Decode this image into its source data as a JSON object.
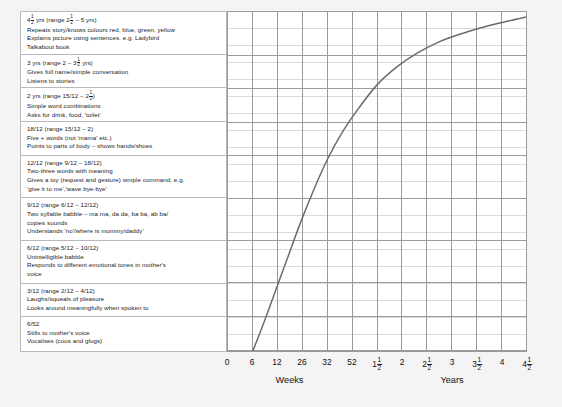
{
  "milestones": [
    {
      "id": "4.5yrs",
      "lines": [
        "4&frac;1;2; yrs (range 2&frac;1;2; – 5 yrs)",
        "Repeats story/knows colours red, blue, green, yellow",
        "Explains picture using sentences. e.g. Ladybird",
        "Talkabout book"
      ]
    },
    {
      "id": "3yrs",
      "lines": [
        "3 yrs (range 2 – 3&frac;1;2; yrs)",
        "Gives full name/simple conversation",
        "Listens to stories"
      ]
    },
    {
      "id": "2yrs",
      "lines": [
        "2 yrs (range 15/12 – 2&frac;1;2;)",
        "Simple word combinations",
        "Asks for drink, food, 'toilet'"
      ]
    },
    {
      "id": "18-12",
      "lines": [
        "18/12 (range 15/12 – 2)",
        "Five + words (not 'mama' etc.)",
        "Points to parts of body – shows hands/shoes"
      ]
    },
    {
      "id": "12-12",
      "lines": [
        "12/12 (range 9/12 – 18/12)",
        "Two-three words with meaning",
        "Gives a toy (request and gesture) simple command, e.g.",
        "'give it to me','wave bye-bye'"
      ]
    },
    {
      "id": "9-12",
      "lines": [
        "9/12 (range 6/12 – 12/12)",
        "Two syllable babble – ma ma, da da, ba ba, ab ba/",
        "copies sounds",
        "Understands 'no'/where is mummy/daddy'"
      ]
    },
    {
      "id": "6-12",
      "lines": [
        "6/12 (range 5/12 – 10/12)",
        "Unintelligible babble",
        "Responds to different emotional tones in mother's",
        "voice"
      ]
    },
    {
      "id": "3-12",
      "lines": [
        "3/12 (range 2/12 – 4/12)",
        "Laughs/squeals of pleasure",
        "Looks around meaningfully when spoken to"
      ]
    },
    {
      "id": "6-52",
      "lines": [
        "6/52",
        "Stills to mother's voice",
        "Vocalises (coos and glugs)"
      ]
    }
  ],
  "chart_data": {
    "type": "line",
    "title": "",
    "xlabel": "",
    "ylabel": "",
    "grid": true,
    "legend": null,
    "x_tick_labels": [
      "0",
      "6",
      "12",
      "26",
      "32",
      "52",
      "1&frac;1;2;",
      "2",
      "2&frac;1;2;",
      "3",
      "3&frac;1;2;",
      "4",
      "4&frac;1;2;"
    ],
    "x_axis_groups": [
      {
        "label": "Weeks",
        "from_index": 0,
        "to_index": 5
      },
      {
        "label": "Years",
        "from_index": 6,
        "to_index": 12
      }
    ],
    "series": [
      {
        "name": "Speech and language development",
        "color": "#6b6b6b",
        "points": [
          {
            "x_index": 1.0,
            "y_frac": 0.0
          },
          {
            "x_index": 1.45,
            "y_frac": 0.085
          },
          {
            "x_index": 1.9,
            "y_frac": 0.175
          },
          {
            "x_index": 2.4,
            "y_frac": 0.275
          },
          {
            "x_index": 2.9,
            "y_frac": 0.375
          },
          {
            "x_index": 3.45,
            "y_frac": 0.475
          },
          {
            "x_index": 4.0,
            "y_frac": 0.565
          },
          {
            "x_index": 4.6,
            "y_frac": 0.645
          },
          {
            "x_index": 5.25,
            "y_frac": 0.715
          },
          {
            "x_index": 6.0,
            "y_frac": 0.785
          },
          {
            "x_index": 6.8,
            "y_frac": 0.838
          },
          {
            "x_index": 7.6,
            "y_frac": 0.878
          },
          {
            "x_index": 8.5,
            "y_frac": 0.912
          },
          {
            "x_index": 9.4,
            "y_frac": 0.936
          },
          {
            "x_index": 10.3,
            "y_frac": 0.956
          },
          {
            "x_index": 11.2,
            "y_frac": 0.972
          },
          {
            "x_index": 12.0,
            "y_frac": 0.985
          }
        ]
      }
    ],
    "columns": 12,
    "rows": 20
  },
  "style": {
    "grid_minor_color": "#dcdcdc",
    "grid_major_color": "#9a9a9a",
    "curve_color": "#6b6b6b",
    "panel_border": "#b9b9b9",
    "page_background": "#f4f4f4"
  }
}
